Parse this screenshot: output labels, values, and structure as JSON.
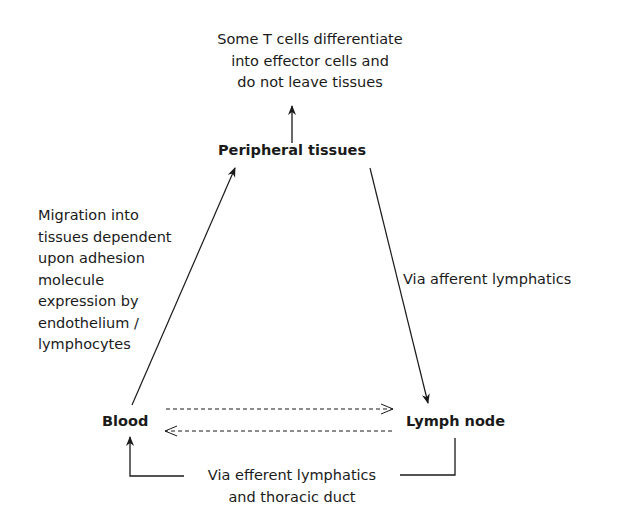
{
  "nodes": {
    "peripheral": {
      "label": "Peripheral tissues"
    },
    "blood": {
      "label": "Blood"
    },
    "lymph_node": {
      "label": "Lymph node"
    }
  },
  "annotations": {
    "top_note": [
      "Some T cells differentiate",
      "into effector cells and",
      "do not leave tissues"
    ],
    "migration_note": [
      "Migration into",
      "tissues dependent",
      "upon adhesion",
      "molecule",
      "expression by",
      "endothelium /",
      "lymphocytes"
    ],
    "afferent_note": "Via afferent lymphatics",
    "efferent_note": [
      "Via efferent lymphatics",
      "and thoracic duct"
    ]
  },
  "colors": {
    "line": "#1a1a1a",
    "background": "#ffffff"
  }
}
